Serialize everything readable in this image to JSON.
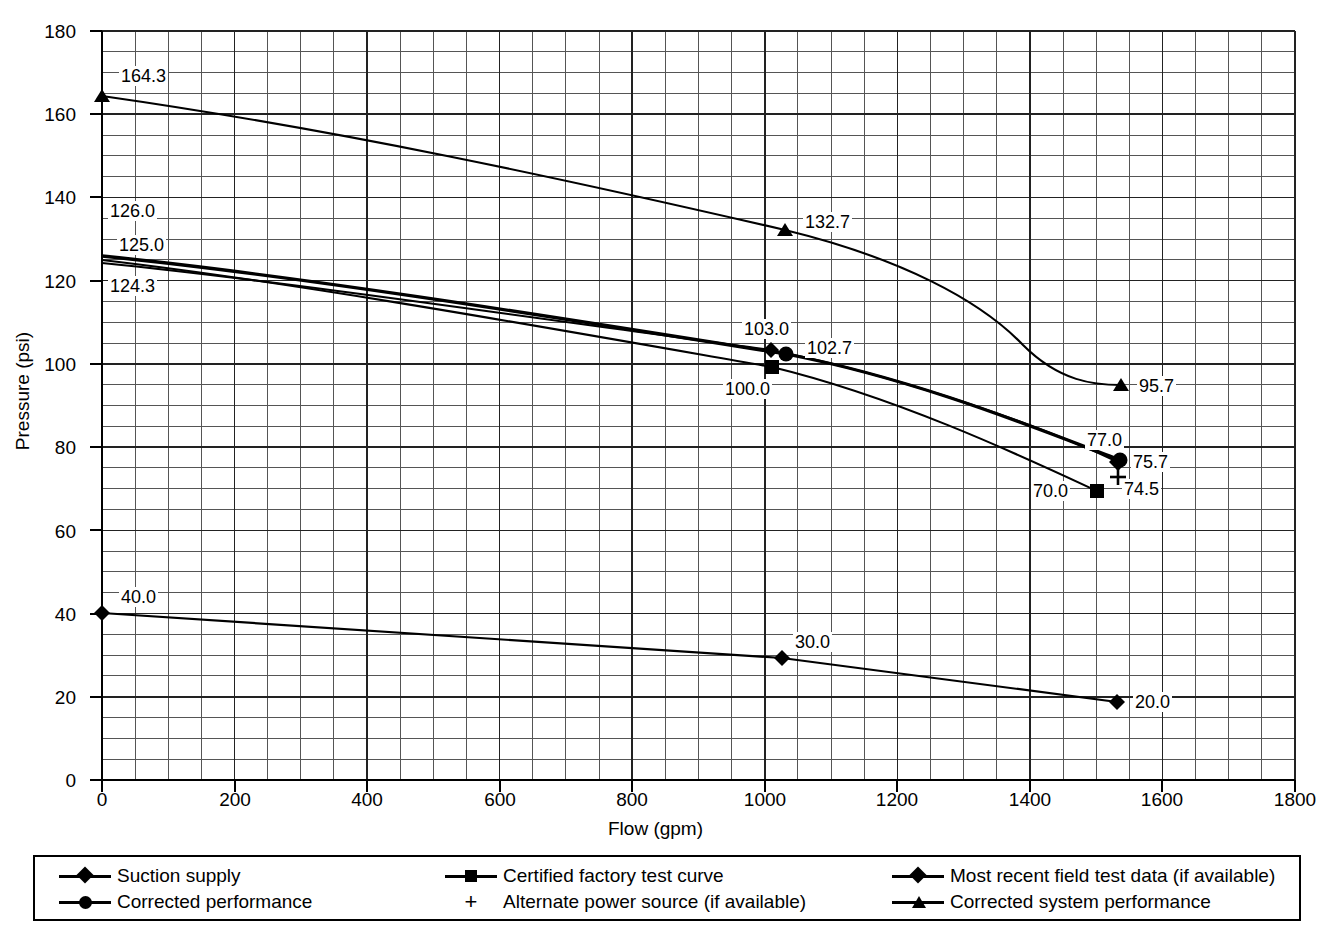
{
  "chart_data": {
    "type": "line",
    "title": "",
    "xlabel": "Flow (gpm)",
    "ylabel": "Pressure (psi)",
    "xlim": [
      0,
      1800
    ],
    "ylim": [
      0,
      180
    ],
    "xticks": [
      0,
      200,
      400,
      600,
      800,
      1000,
      1200,
      1400,
      1600,
      1800
    ],
    "yticks": [
      0,
      20,
      40,
      60,
      80,
      100,
      120,
      140,
      160,
      180
    ],
    "x_major_step": 200,
    "x_minor_step": 50,
    "y_major_step": 20,
    "y_minor_step": 5,
    "grid": true,
    "legend_position": "below-plot",
    "series": [
      {
        "name": "Suction supply",
        "marker": "diamond",
        "x": [
          0,
          1000,
          1530
        ],
        "y": [
          40.0,
          30.0,
          20.0
        ],
        "labels": [
          "40.0",
          "30.0",
          "20.0"
        ]
      },
      {
        "name": "Corrected performance",
        "marker": "circle",
        "x": [
          0,
          1020,
          1530
        ],
        "y": [
          126.0,
          102.7,
          77.0
        ],
        "labels": [
          "126.0",
          "102.7",
          "77.0"
        ]
      },
      {
        "name": "Certified factory test curve",
        "marker": "square",
        "x": [
          0,
          1000,
          1500
        ],
        "y": [
          125.0,
          100.0,
          70.0
        ],
        "labels": [
          "125.0",
          "100.0",
          "70.0"
        ]
      },
      {
        "name": "Most recent field test data (if available)",
        "marker": "diamond",
        "x": [
          0,
          1000,
          1530
        ],
        "y": [
          124.3,
          103.0,
          75.7
        ],
        "labels": [
          "124.3",
          "103.0",
          "75.7"
        ]
      },
      {
        "name": "Corrected system performance",
        "marker": "triangle",
        "x": [
          0,
          1030,
          1530
        ],
        "y": [
          164.3,
          132.7,
          95.7
        ],
        "labels": [
          "164.3",
          "132.7",
          "95.7"
        ]
      },
      {
        "name": "Alternate power source (if available)",
        "marker": "plus",
        "x": [
          1530
        ],
        "y": [
          74.5
        ],
        "labels": [
          "74.5"
        ]
      }
    ],
    "point_labels": [
      {
        "text": "164.3"
      },
      {
        "text": "126.0"
      },
      {
        "text": "125.0"
      },
      {
        "text": "124.3"
      },
      {
        "text": "132.7"
      },
      {
        "text": "103.0"
      },
      {
        "text": "102.7"
      },
      {
        "text": "100.0"
      },
      {
        "text": "95.7"
      },
      {
        "text": "77.0"
      },
      {
        "text": "75.7"
      },
      {
        "text": "74.5"
      },
      {
        "text": "70.0"
      },
      {
        "text": "40.0"
      },
      {
        "text": "30.0"
      },
      {
        "text": "20.0"
      }
    ]
  },
  "axes": {
    "ylabel": "Pressure (psi)",
    "xlabel": "Flow (gpm)",
    "yticks": [
      "180",
      "160",
      "140",
      "120",
      "100",
      "80",
      "60",
      "40",
      "20",
      "0"
    ],
    "xticks": [
      "0",
      "200",
      "400",
      "600",
      "800",
      "1000",
      "1200",
      "1400",
      "1600",
      "1800"
    ]
  },
  "labels": {
    "l_164_3": "164.3",
    "l_126_0": "126.0",
    "l_125_0": "125.0",
    "l_124_3": "124.3",
    "l_132_7": "132.7",
    "l_103_0": "103.0",
    "l_102_7": "102.7",
    "l_100_0": "100.0",
    "l_95_7": "95.7",
    "l_77_0": "77.0",
    "l_75_7": "75.7",
    "l_74_5": "74.5",
    "l_70_0": "70.0",
    "l_40_0": "40.0",
    "l_30_0": "30.0",
    "l_20_0": "20.0"
  },
  "legend": {
    "items": [
      {
        "label": "Suction supply",
        "marker": "diamond"
      },
      {
        "label": "Corrected performance",
        "marker": "circle"
      },
      {
        "label": "Certified factory test curve",
        "marker": "square"
      },
      {
        "label": "Alternate power source (if available)",
        "marker": "plus"
      },
      {
        "label": "Most recent field test data (if available)",
        "marker": "diamond"
      },
      {
        "label": "Corrected system performance",
        "marker": "triangle"
      }
    ],
    "plus_glyph": "+"
  },
  "colors": {
    "ink": "#000000",
    "grid": "#555555",
    "background": "#ffffff"
  }
}
